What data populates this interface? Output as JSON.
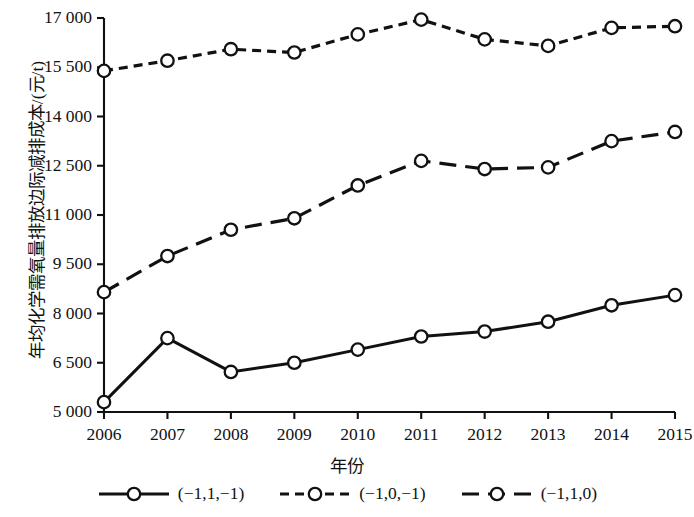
{
  "chart_data": {
    "type": "line",
    "title": "",
    "xlabel": "年份",
    "ylabel": "年均化学需氧量排放边际减排成本/(元/t)",
    "x": [
      2006,
      2007,
      2008,
      2009,
      2010,
      2011,
      2012,
      2013,
      2014,
      2015
    ],
    "categories": [
      "2006",
      "2007",
      "2008",
      "2009",
      "2010",
      "2011",
      "2012",
      "2013",
      "2014",
      "2015"
    ],
    "xlim": [
      2006,
      2015
    ],
    "ylim": [
      5000,
      17000
    ],
    "yticks": [
      5000,
      6500,
      8000,
      9500,
      11000,
      12500,
      14000,
      15500,
      17000
    ],
    "ytick_labels": [
      "5 000",
      "6 500",
      "8 000",
      "9 500",
      "11 000",
      "12 500",
      "14 000",
      "15 500",
      "17 000"
    ],
    "grid": false,
    "legend_position": "bottom",
    "marker": "circle-open",
    "series": [
      {
        "name": "(−1,1,−1)",
        "style": "solid",
        "color": "#111111",
        "values": [
          5300,
          7250,
          6220,
          6500,
          6900,
          7300,
          7450,
          7750,
          8250,
          8560
        ]
      },
      {
        "name": "(−1,0,−1)",
        "style": "dotted",
        "color": "#111111",
        "values": [
          15390,
          15700,
          16050,
          15950,
          16500,
          16950,
          16350,
          16150,
          16700,
          16750
        ]
      },
      {
        "name": "(−1,1,0)",
        "style": "dashed",
        "color": "#111111",
        "values": [
          8650,
          9750,
          10550,
          10900,
          11900,
          12650,
          12400,
          12450,
          13250,
          13530
        ]
      }
    ]
  },
  "axis": {
    "x_title": "年份",
    "y_title": "年均化学需氧量排放边际减排成本/(元/t)"
  },
  "legend": {
    "items": [
      {
        "label": "(−1,1,−1)",
        "style": "solid"
      },
      {
        "label": "(−1,0,−1)",
        "style": "dotted"
      },
      {
        "label": "(−1,1,0)",
        "style": "dashed"
      }
    ]
  }
}
